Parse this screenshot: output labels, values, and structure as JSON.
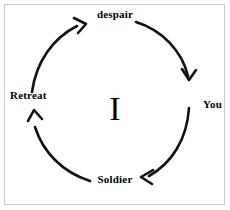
{
  "diagram": {
    "title": "",
    "type": "cycle",
    "direction": "clockwise",
    "center_label": "I",
    "stroke_color": "#111111",
    "border_color": "#c9c9c9",
    "background_color": "#ffffff",
    "nodes": [
      {
        "id": "despair",
        "label": "despair",
        "position": "top"
      },
      {
        "id": "you",
        "label": "You",
        "position": "right"
      },
      {
        "id": "soldier",
        "label": "Soldier",
        "position": "bottom"
      },
      {
        "id": "retreat",
        "label": "Retreat",
        "position": "left"
      }
    ],
    "arrows": [
      {
        "id": "despair-to-you",
        "from": "despair",
        "to": "You",
        "head": "down"
      },
      {
        "id": "you-to-soldier",
        "from": "You",
        "to": "Soldier",
        "head": "left"
      },
      {
        "id": "soldier-to-retreat",
        "from": "Soldier",
        "to": "Retreat",
        "head": "up"
      },
      {
        "id": "retreat-to-despair",
        "from": "Retreat",
        "to": "despair",
        "head": "up-right"
      }
    ]
  }
}
